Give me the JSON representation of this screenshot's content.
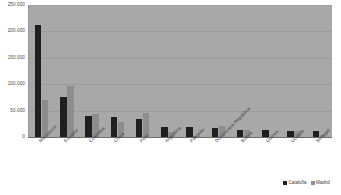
{
  "chart_data": {
    "type": "bar",
    "title": "",
    "xlabel": "",
    "ylabel": "",
    "ylim": [
      0,
      250000
    ],
    "grid": true,
    "legend_position": "bottom-right",
    "yticks": [
      "0",
      "50.000",
      "100.000",
      "150.000",
      "200.000",
      "250.000"
    ],
    "ytick_values": [
      0,
      50000,
      100000,
      150000,
      200000,
      250000
    ],
    "categories": [
      "Marruecos",
      "Ecuador",
      "Colombia",
      "China",
      "Perú",
      "Argentina",
      "Pakistán",
      "Dominicana República",
      "Bolivia",
      "Guinea",
      "Ucrania",
      "Senegal"
    ],
    "series": [
      {
        "name": "Cataluña",
        "color": "#1f1f1f",
        "values": [
          212000,
          76000,
          40000,
          38000,
          34000,
          19000,
          19000,
          17000,
          13000,
          13000,
          11000,
          11000
        ]
      },
      {
        "name": "Madrid",
        "color": "#8d8d8d",
        "values": [
          70000,
          97000,
          44000,
          28000,
          46000,
          10000,
          2000,
          21000,
          13000,
          0,
          11000,
          3000
        ]
      }
    ]
  },
  "legend": {
    "items": [
      {
        "label": "Cataluña"
      },
      {
        "label": "Madrid"
      }
    ]
  }
}
